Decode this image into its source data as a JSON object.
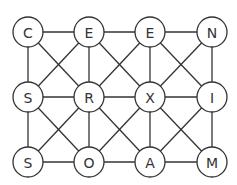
{
  "puzzle": {
    "grid": [
      [
        "C",
        "E",
        "E",
        "N"
      ],
      [
        "S",
        "R",
        "X",
        "I"
      ],
      [
        "S",
        "O",
        "A",
        "M"
      ]
    ],
    "connections": "orthogonal-and-diagonal",
    "colors": {
      "line": "#333333",
      "node_fill": "#ffffff",
      "text": "#333333"
    }
  }
}
